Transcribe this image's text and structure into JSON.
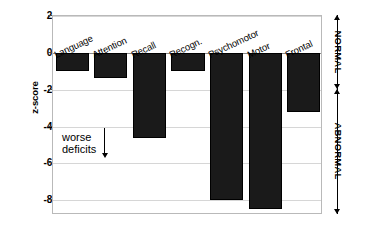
{
  "chart_data": {
    "type": "bar",
    "title": "",
    "subtitle": "",
    "xlabel": "",
    "ylabel": "z-score",
    "orientation": "vertical",
    "grid": true,
    "legend": "none",
    "ylim": [
      -8.8,
      2
    ],
    "yticks": [
      2,
      0,
      -2,
      -4,
      -6,
      -8
    ],
    "ytick_labels": [
      "2",
      "0",
      "-2",
      "-4",
      "-6",
      "-8"
    ],
    "categories": [
      "Language",
      "Attention",
      "Recall",
      "Recogn.",
      "Psychomotor",
      "Motor",
      "Frontal"
    ],
    "values": [
      -1.0,
      -1.35,
      -4.6,
      -1.0,
      -8.0,
      -8.5,
      -3.2
    ],
    "bar_color": "#1a1a1a",
    "annotations": [
      {
        "name": "worse-deficits",
        "line1": "worse",
        "line2": "deficits",
        "arrow": "down-arrow"
      },
      {
        "name": "normal-range",
        "label": "NORMAL",
        "from": 2,
        "to": -2,
        "marker": "double-arrow"
      },
      {
        "name": "abnormal-range",
        "label": "ABNORMAL",
        "from": -2,
        "to": -8.8,
        "marker": "double-arrow"
      }
    ]
  }
}
